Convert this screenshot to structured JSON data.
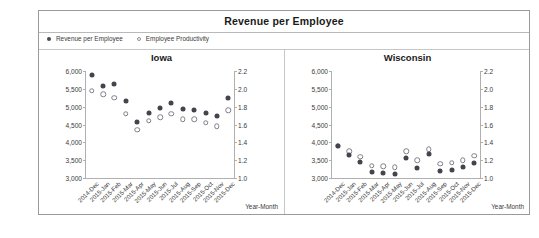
{
  "header": {
    "title": "Revenue per Employee"
  },
  "legend": {
    "position": "top-left",
    "items": [
      {
        "label": "Revenue per Employee",
        "marker": "filled-circle-icon",
        "color": "#44444c"
      },
      {
        "label": "Employee Productivity",
        "marker": "hollow-circle-icon",
        "color": "#7e7e88"
      }
    ]
  },
  "axis_titles": {
    "x_left": "Year-Month",
    "x_right": "Year-Month"
  },
  "chart_data": [
    {
      "type": "scatter",
      "title": "Iowa",
      "xlabel": "Year-Month",
      "ylabel": "",
      "grid": false,
      "legend_position": "top-left",
      "categories": [
        "2014-Dec",
        "2015-Jan",
        "2015-Feb",
        "2015-Mar",
        "2015-Apr",
        "2015-May",
        "2015-Jun",
        "2015-Jul",
        "2015-Aug",
        "2015-Sep",
        "2015-Oct",
        "2015-Nov",
        "2015-Dec"
      ],
      "y_left_ticks": [
        "3,000",
        "3,500",
        "4,000",
        "4,500",
        "5,000",
        "5,500",
        "6,000"
      ],
      "y_right_ticks": [
        "1.0",
        "1.2",
        "1.4",
        "1.6",
        "1.8",
        "2.0",
        "2.2"
      ],
      "ylim_left": [
        3000,
        6000
      ],
      "ylim_right": [
        1.0,
        2.2
      ],
      "series": [
        {
          "name": "Revenue per Employee",
          "axis": "left",
          "marker": "filled-circle-icon",
          "values": [
            5880,
            5590,
            5640,
            5160,
            4560,
            4830,
            4950,
            5100,
            4930,
            4920,
            4830,
            4740,
            5230
          ]
        },
        {
          "name": "Employee Productivity",
          "axis": "right",
          "marker": "hollow-circle-icon",
          "values": [
            1.98,
            1.94,
            1.9,
            1.72,
            1.54,
            1.64,
            1.68,
            1.72,
            1.66,
            1.66,
            1.62,
            1.58,
            1.76
          ]
        }
      ]
    },
    {
      "type": "scatter",
      "title": "Wisconsin",
      "xlabel": "Year-Month",
      "ylabel": "",
      "grid": false,
      "legend_position": "top-left",
      "categories": [
        "2014-Dec",
        "2015-Jan",
        "2015-Feb",
        "2015-Mar",
        "2015-Apr",
        "2015-May",
        "2015-Jun",
        "2015-Jul",
        "2015-Aug",
        "2015-Sep",
        "2015-Oct",
        "2015-Nov",
        "2015-Dec"
      ],
      "y_left_ticks": [
        "3,000",
        "3,500",
        "4,000",
        "4,500",
        "5,000",
        "5,500",
        "6,000"
      ],
      "y_right_ticks": [
        "1.0",
        "1.2",
        "1.4",
        "1.6",
        "1.8",
        "2.0",
        "2.2"
      ],
      "ylim_left": [
        3000,
        6000
      ],
      "ylim_right": [
        1.0,
        2.2
      ],
      "series": [
        {
          "name": "Revenue per Employee",
          "axis": "left",
          "marker": "filled-circle-icon",
          "values": [
            3900,
            3650,
            3440,
            3180,
            3150,
            3120,
            3560,
            3290,
            3660,
            3210,
            3220,
            3300,
            3430
          ]
        },
        {
          "name": "Employee Productivity",
          "axis": "right",
          "marker": "hollow-circle-icon",
          "values": [
            1.36,
            1.3,
            1.24,
            1.14,
            1.13,
            1.12,
            1.3,
            1.2,
            1.32,
            1.16,
            1.17,
            1.2,
            1.25
          ]
        }
      ]
    }
  ]
}
